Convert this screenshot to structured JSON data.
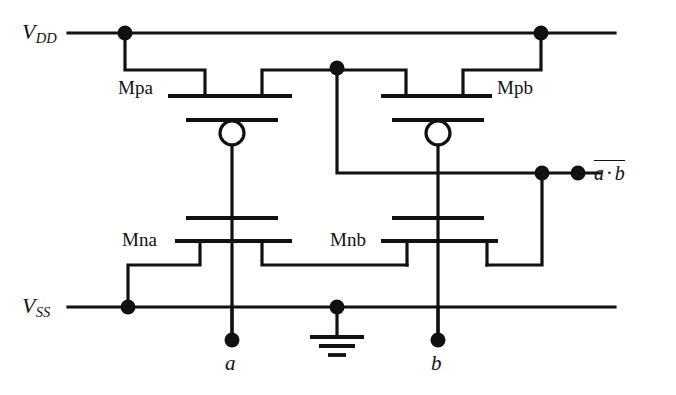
{
  "diagram": {
    "type": "circuit-schematic",
    "stroke_color": "#111111",
    "background_color": "#ffffff"
  },
  "rails": {
    "vdd": {
      "label_v": "V",
      "label_sub": "DD",
      "y": 33
    },
    "vss": {
      "label_v": "V",
      "label_sub": "SS",
      "y": 307
    }
  },
  "devices": {
    "mpa": {
      "label": "Mpa",
      "type": "pmos"
    },
    "mpb": {
      "label": "Mpb",
      "type": "pmos"
    },
    "mna": {
      "label": "Mna",
      "type": "nmos"
    },
    "mnb": {
      "label": "Mnb",
      "type": "nmos"
    }
  },
  "signals": {
    "input_a": "a",
    "input_b": "b",
    "output_left": "a",
    "output_dot": "·",
    "output_right": "b"
  },
  "symbols": {
    "ground": "ground-symbol",
    "junction": "junction-dot",
    "inversion_bubble": "inversion-bubble"
  }
}
